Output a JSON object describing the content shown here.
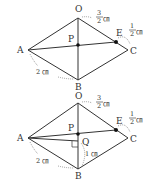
{
  "figures": [
    {
      "id": "top",
      "points": {
        "O": {
          "label": "O",
          "x": 78,
          "y": 18
        },
        "A": {
          "label": "A",
          "x": 28,
          "y": 50
        },
        "B": {
          "label": "B",
          "x": 78,
          "y": 80
        },
        "C": {
          "label": "C",
          "x": 128,
          "y": 50
        },
        "P": {
          "label": "P",
          "x": 78,
          "y": 45
        },
        "E": {
          "label": "E",
          "x": 116,
          "y": 42
        }
      },
      "measures": {
        "OE_num": "3",
        "OE_den": "2",
        "OE_unit": "㎝",
        "EC_num": "1",
        "EC_den": "2",
        "EC_unit": "㎝",
        "AB": "2 ㎝"
      }
    },
    {
      "id": "bottom",
      "points": {
        "O": {
          "label": "O",
          "x": 78,
          "y": 103
        },
        "A": {
          "label": "A",
          "x": 28,
          "y": 138
        },
        "B": {
          "label": "B",
          "x": 78,
          "y": 169
        },
        "C": {
          "label": "C",
          "x": 128,
          "y": 138
        },
        "P": {
          "label": "P",
          "x": 78,
          "y": 134
        },
        "E": {
          "label": "E",
          "x": 116,
          "y": 130
        },
        "Q": {
          "label": "Q",
          "x": 78,
          "y": 141
        }
      },
      "measures": {
        "OE_num": "3",
        "OE_den": "2",
        "OE_unit": "㎝",
        "EC_num": "1",
        "EC_den": "2",
        "EC_unit": "㎝",
        "AB": "2 ㎝",
        "QB": "1 ㎝"
      }
    }
  ]
}
